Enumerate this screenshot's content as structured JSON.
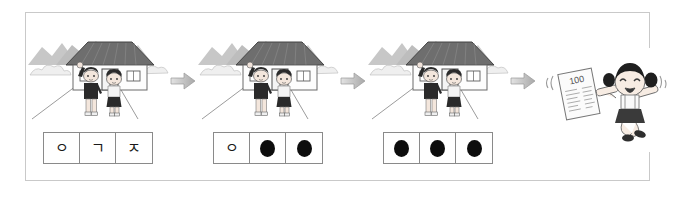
{
  "worksheet": {
    "title": "Korean consonant hint sequence worksheet",
    "frame_border_color": "#c9c9c9",
    "background_color": "#ffffff",
    "arrow_color": "#b0b0b0",
    "dot_color": "#0d0d0d",
    "box_border_color": "#8a8a8a"
  },
  "panels": [
    {
      "id": "panel-1",
      "scene": {
        "name": "house-with-two-children",
        "description": "Two children standing in front of a village house with mountains behind",
        "house_roof_color": "#6e6e6e",
        "house_wall_color": "#fdfdfd",
        "mountain_color": "#c4c4c4",
        "boy": {
          "name": "boy-waving",
          "shirt_color": "#2a2a2a",
          "pose": "arm raised waving"
        },
        "girl": {
          "name": "girl-standing",
          "top_color": "#f2f2f2",
          "skirt_color": "#2a2a2a",
          "pose": "hands together"
        }
      },
      "cells": [
        {
          "type": "letter",
          "value": "ㅇ"
        },
        {
          "type": "letter",
          "value": "ㄱ"
        },
        {
          "type": "letter",
          "value": "ㅈ"
        }
      ]
    },
    {
      "id": "panel-2",
      "scene": {
        "name": "house-with-two-children",
        "description": "Two children standing in front of a village house with mountains behind",
        "house_roof_color": "#6e6e6e",
        "house_wall_color": "#fdfdfd",
        "mountain_color": "#c4c4c4",
        "boy": {
          "name": "boy-waving",
          "shirt_color": "#2a2a2a",
          "pose": "arm raised waving"
        },
        "girl": {
          "name": "girl-standing",
          "top_color": "#f2f2f2",
          "skirt_color": "#2a2a2a",
          "pose": "hands together"
        }
      },
      "cells": [
        {
          "type": "letter",
          "value": "ㅇ"
        },
        {
          "type": "dot",
          "value": ""
        },
        {
          "type": "dot",
          "value": ""
        }
      ]
    },
    {
      "id": "panel-3",
      "scene": {
        "name": "house-with-two-children",
        "description": "Two children standing in front of a village house with mountains behind",
        "house_roof_color": "#6e6e6e",
        "house_wall_color": "#fdfdfd",
        "mountain_color": "#c4c4c4",
        "boy": {
          "name": "boy-waving",
          "shirt_color": "#2a2a2a",
          "pose": "arm raised waving"
        },
        "girl": {
          "name": "girl-standing",
          "top_color": "#f2f2f2",
          "skirt_color": "#2a2a2a",
          "pose": "hands together"
        }
      },
      "cells": [
        {
          "type": "dot",
          "value": ""
        },
        {
          "type": "dot",
          "value": ""
        },
        {
          "type": "dot",
          "value": ""
        }
      ]
    }
  ],
  "final_panel": {
    "id": "panel-4",
    "scene": {
      "name": "girl-jumping-with-test-paper",
      "description": "Cheerful girl with pigtails jumping while holding a test paper",
      "hair_color": "#1f1f1f",
      "top_color": "#fafafa",
      "skirt_color": "#3a3a3a",
      "paper_color": "#fbfbfb",
      "paper_score": "100"
    }
  },
  "arrows": [
    {
      "name": "arrow-1",
      "direction": "right"
    },
    {
      "name": "arrow-2",
      "direction": "right"
    },
    {
      "name": "arrow-3",
      "direction": "right"
    }
  ]
}
